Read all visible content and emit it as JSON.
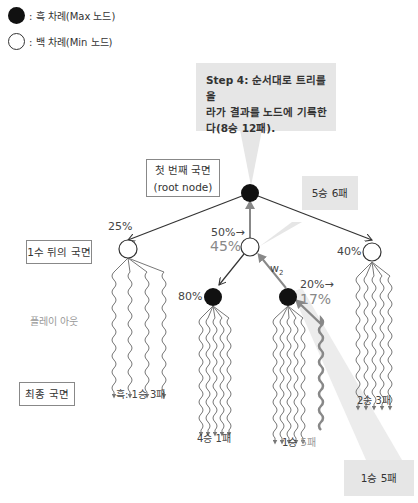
{
  "legend": {
    "max": {
      "icon": "black-circle-icon",
      "label": ": 흑 차례(Max 노드)"
    },
    "min": {
      "icon": "white-circle-icon",
      "label": ": 백 차례(Min 노드)"
    }
  },
  "callouts": {
    "step4": {
      "line1": "Step 4: 순서대로 트리를 올",
      "line2": "라가 결과를 노드에 기록한",
      "line3": "다(8승 12패)."
    },
    "root_result": "5승 6패",
    "playout_result": "1승 5패"
  },
  "labels": {
    "root": {
      "line1": "첫 번째 국면",
      "line2": "(root node)"
    },
    "after_one_move": "1수 뒤의 국면",
    "playout": "플레이 아웃",
    "final": "최종 국면"
  },
  "nodes": {
    "left": {
      "pct": "25%"
    },
    "middle": {
      "pct_before": "50%→",
      "pct_after": "45%"
    },
    "right": {
      "pct": "40%"
    },
    "mid_left": {
      "pct": "80%"
    },
    "mid_right": {
      "pct_before": "20%→",
      "pct_after": "17%",
      "edge_label": "w",
      "edge_sub": "2"
    }
  },
  "results": {
    "left": "흑: 1승 3패",
    "mid_left": "4승 1패",
    "mid_right_prefix": "1승 ",
    "mid_right_suffix": "5패",
    "right": "2승 3패"
  },
  "colors": {
    "callout_bg": "#e6e6e6",
    "node_black": "#111111",
    "edge": "#333333",
    "highlight_edge": "#888888"
  }
}
